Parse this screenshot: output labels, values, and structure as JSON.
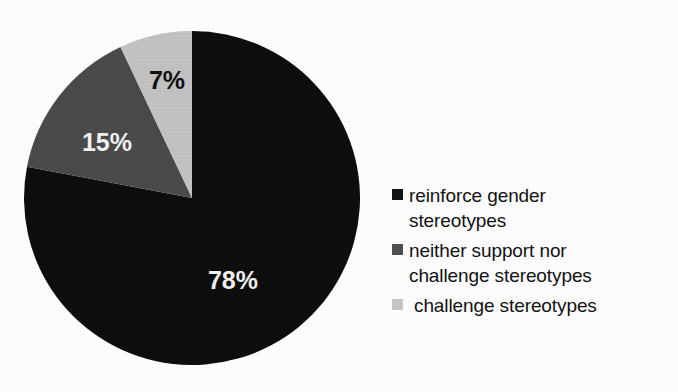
{
  "chart_data": {
    "type": "pie",
    "title": "",
    "labels": [
      "reinforce gender stereotypes",
      "neither support nor challenge stereotypes",
      "challenge stereotypes"
    ],
    "values": [
      78,
      15,
      7
    ],
    "value_labels": [
      "78%",
      "15%",
      "7%"
    ],
    "colors": [
      "#0e0e0e",
      "#4a4a4a",
      "#c2c2c2"
    ],
    "unit": "%",
    "start_angle_deg": 0,
    "direction": "clockwise",
    "legend_position": "right",
    "grid": false
  },
  "pie": {
    "slices": [
      {
        "name": "reinforce gender stereotypes",
        "value": 78,
        "value_label": "78%",
        "color": "#0e0e0e",
        "label_color": "on-dark"
      },
      {
        "name": "neither support nor challenge stereotypes",
        "value": 15,
        "value_label": "15%",
        "color": "#4a4a4a",
        "label_color": "on-dark"
      },
      {
        "name": "challenge stereotypes",
        "value": 7,
        "value_label": "7%",
        "color": "#c2c2c2",
        "label_color": "on-light"
      }
    ]
  },
  "legend": {
    "items": [
      {
        "label": "reinforce gender\nstereotypes",
        "color": "#121212",
        "marker": "square-marker"
      },
      {
        "label": "neither support nor\nchallenge stereotypes",
        "color": "#4f4f4f",
        "marker": "square-marker"
      },
      {
        "label": "challenge stereotypes",
        "color": "#c6c6c6",
        "marker": "square-marker"
      }
    ]
  }
}
